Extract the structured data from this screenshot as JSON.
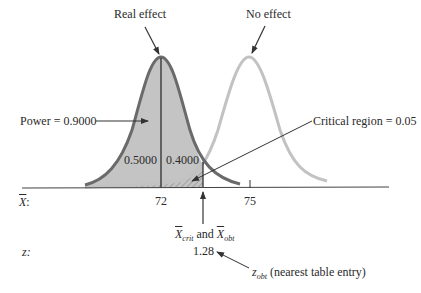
{
  "labels": {
    "real_effect": "Real effect",
    "no_effect": "No effect",
    "power": "Power = 0.9000",
    "critical_region": "Critical region = 0.05",
    "left_area": "0.5000",
    "right_area": "0.4000",
    "xbar_axis_label": "X",
    "xbar_axis_colon": ":",
    "z_axis_label": "z:",
    "tick_72": "72",
    "tick_75": "75",
    "xcrit_x": "X",
    "xcrit_sub": "crit",
    "and_text": "and",
    "xobt_x": "X",
    "xobt_sub": "obt",
    "z_value": "1.28",
    "zobt_z": "z",
    "zobt_sub": "obt",
    "zobt_note": "(nearest table entry)"
  },
  "colors": {
    "real_curve": "#6a6a6a",
    "real_fill": "#c4c4c4",
    "no_effect_curve": "#c2c2c2",
    "axis": "#444444"
  }
}
